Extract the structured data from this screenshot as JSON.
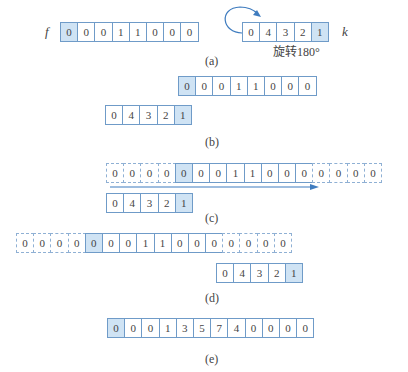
{
  "colors": {
    "border": "#6f9bc8",
    "highlight": "#cfe3f4",
    "arrow": "#3f7cbf"
  },
  "panel_a": {
    "f_label": "f",
    "f": [
      "0",
      "0",
      "0",
      "1",
      "1",
      "0",
      "0",
      "0"
    ],
    "k_label": "k",
    "k": [
      "0",
      "4",
      "3",
      "2",
      "1"
    ],
    "rotate_text": "旋转180°",
    "caption": "(a)"
  },
  "panel_b": {
    "f": [
      "0",
      "0",
      "0",
      "1",
      "1",
      "0",
      "0",
      "0"
    ],
    "k": [
      "0",
      "4",
      "3",
      "2",
      "1"
    ],
    "caption": "(b)"
  },
  "panel_c": {
    "f_padded": [
      "0",
      "0",
      "0",
      "0",
      "0",
      "0",
      "0",
      "1",
      "1",
      "0",
      "0",
      "0",
      "0",
      "0",
      "0",
      "0"
    ],
    "k": [
      "0",
      "4",
      "3",
      "2",
      "1"
    ],
    "caption": "(c)"
  },
  "panel_d": {
    "f_padded": [
      "0",
      "0",
      "0",
      "0",
      "0",
      "0",
      "0",
      "1",
      "1",
      "0",
      "0",
      "0",
      "0",
      "0",
      "0",
      "0"
    ],
    "k": [
      "0",
      "4",
      "3",
      "2",
      "1"
    ],
    "caption": "(d)"
  },
  "panel_e": {
    "result": [
      "0",
      "0",
      "0",
      "1",
      "3",
      "5",
      "7",
      "4",
      "0",
      "0",
      "0",
      "0"
    ],
    "caption": "(e)"
  }
}
